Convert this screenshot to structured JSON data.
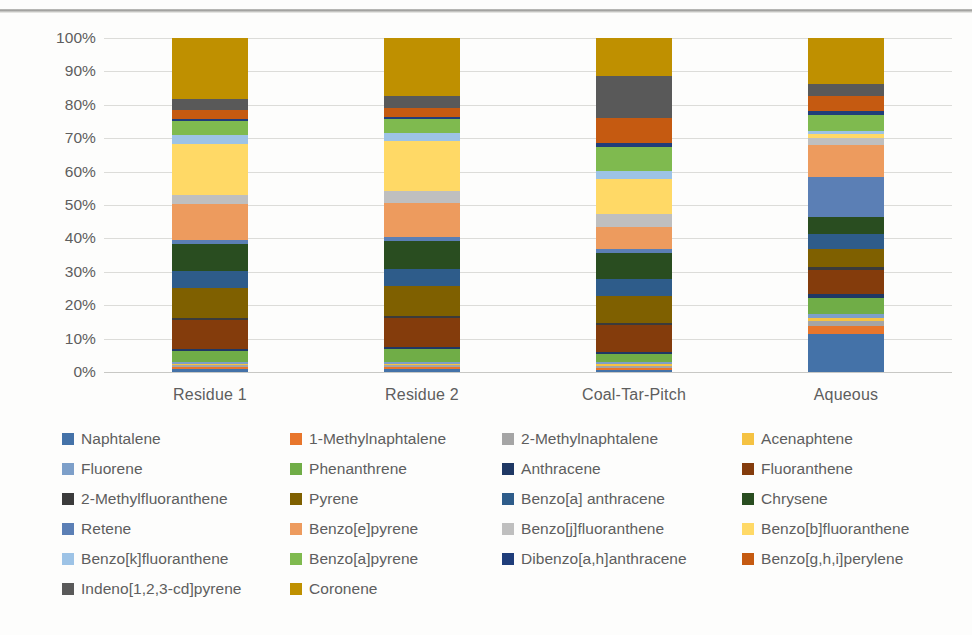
{
  "chart_data": {
    "type": "bar",
    "subtype": "100% stacked bar",
    "title": "",
    "xlabel": "",
    "ylabel": "",
    "ylim": [
      0,
      100
    ],
    "grid": true,
    "legend_position": "bottom",
    "y_ticks": [
      "0%",
      "10%",
      "20%",
      "30%",
      "40%",
      "50%",
      "60%",
      "70%",
      "80%",
      "90%",
      "100%"
    ],
    "categories": [
      "Residue 1",
      "Residue 2",
      "Coal-Tar-Pitch",
      "Aqueous"
    ],
    "series": [
      {
        "name": "Naphtalene",
        "color": "#4472a8",
        "values": [
          0.8,
          0.8,
          0.7,
          11.5
        ]
      },
      {
        "name": "1-Methylnaphtalene",
        "color": "#e8762c",
        "values": [
          0.6,
          0.6,
          0.6,
          2.4
        ]
      },
      {
        "name": "2-Methylnaphtalene",
        "color": "#a5a5a5",
        "values": [
          0.6,
          0.6,
          0.6,
          1.5
        ]
      },
      {
        "name": "Acenaphtene",
        "color": "#f5c242",
        "values": [
          0.5,
          0.5,
          0.5,
          0.9
        ]
      },
      {
        "name": "Fluorene",
        "color": "#7d9fc9",
        "values": [
          0.6,
          0.6,
          0.6,
          1.2
        ]
      },
      {
        "name": "Phenanthrene",
        "color": "#70ad47",
        "values": [
          3.3,
          3.9,
          2.6,
          4.8
        ]
      },
      {
        "name": "Anthracene",
        "color": "#1f3864",
        "values": [
          0.6,
          0.6,
          0.6,
          1.0
        ]
      },
      {
        "name": "Fluoranthene",
        "color": "#843c0c",
        "values": [
          8.6,
          8.7,
          8.0,
          7.2
        ]
      },
      {
        "name": "2-Methylfluoranthene",
        "color": "#3b3b3b",
        "values": [
          0.6,
          0.6,
          0.6,
          0.8
        ]
      },
      {
        "name": "Pyrene",
        "color": "#7f6000",
        "values": [
          8.9,
          9.0,
          8.3,
          5.6
        ]
      },
      {
        "name": "Benzo[a] anthracene",
        "color": "#2e5c8a",
        "values": [
          5.2,
          5.3,
          5.3,
          4.3
        ]
      },
      {
        "name": "Chrysene",
        "color": "#294d20",
        "values": [
          8.0,
          8.3,
          7.7,
          5.1
        ]
      },
      {
        "name": "Retene",
        "color": "#5b7fb5",
        "values": [
          1.1,
          1.2,
          1.2,
          12.2
        ]
      },
      {
        "name": "Benzo[e]pyrene",
        "color": "#ed9b5e",
        "values": [
          10.9,
          10.5,
          6.9,
          9.4
        ]
      },
      {
        "name": "Benzo[j]fluoranthene",
        "color": "#bfbfbf",
        "values": [
          2.6,
          3.6,
          3.9,
          2.2
        ]
      },
      {
        "name": "Benzo[b]fluoranthene",
        "color": "#ffd966",
        "values": [
          15.5,
          15.1,
          10.5,
          1.2
        ]
      },
      {
        "name": "Benzo[k]fluoranthene",
        "color": "#9dc3e6",
        "values": [
          2.6,
          2.5,
          2.6,
          1.0
        ]
      },
      {
        "name": "Benzo[a]pyrene",
        "color": "#7fba4f",
        "values": [
          4.2,
          4.0,
          7.1,
          4.6
        ]
      },
      {
        "name": "Dibenzo[a,h]anthracene",
        "color": "#1f3d7a",
        "values": [
          0.7,
          0.7,
          1.4,
          1.2
        ]
      },
      {
        "name": "Benzo[g,h,i]perylene",
        "color": "#c55a11",
        "values": [
          2.6,
          2.8,
          7.7,
          4.4
        ]
      },
      {
        "name": "Indeno[1,2,3-cd]pyrene",
        "color": "#595959",
        "values": [
          3.3,
          3.6,
          12.6,
          3.8
        ]
      },
      {
        "name": "Coronene",
        "color": "#bf9000",
        "values": [
          18.2,
          17.5,
          11.6,
          13.7
        ]
      }
    ]
  },
  "axis": {
    "y_ticks": [
      "100%",
      "90%",
      "80%",
      "70%",
      "60%",
      "50%",
      "40%",
      "30%",
      "20%",
      "10%",
      "0%"
    ],
    "x_labels": [
      "Residue 1",
      "Residue 2",
      "Coal-Tar-Pitch",
      "Aqueous"
    ]
  },
  "legend": {
    "rows": [
      [
        {
          "label": "Naphtalene",
          "color": "#4472a8"
        },
        {
          "label": "1-Methylnaphtalene",
          "color": "#e8762c"
        },
        {
          "label": "2-Methylnaphtalene",
          "color": "#a5a5a5"
        },
        {
          "label": "Acenaphtene",
          "color": "#f5c242"
        }
      ],
      [
        {
          "label": "Fluorene",
          "color": "#7d9fc9"
        },
        {
          "label": "Phenanthrene",
          "color": "#70ad47"
        },
        {
          "label": "Anthracene",
          "color": "#1f3864"
        },
        {
          "label": "Fluoranthene",
          "color": "#843c0c"
        }
      ],
      [
        {
          "label": "2-Methylfluoranthene",
          "color": "#3b3b3b"
        },
        {
          "label": "Pyrene",
          "color": "#7f6000"
        },
        {
          "label": "Benzo[a] anthracene",
          "color": "#2e5c8a"
        },
        {
          "label": "Chrysene",
          "color": "#294d20"
        }
      ],
      [
        {
          "label": "Retene",
          "color": "#5b7fb5"
        },
        {
          "label": "Benzo[e]pyrene",
          "color": "#ed9b5e"
        },
        {
          "label": "Benzo[j]fluoranthene",
          "color": "#bfbfbf"
        },
        {
          "label": "Benzo[b]fluoranthene",
          "color": "#ffd966"
        }
      ],
      [
        {
          "label": "Benzo[k]fluoranthene",
          "color": "#9dc3e6"
        },
        {
          "label": "Benzo[a]pyrene",
          "color": "#7fba4f"
        },
        {
          "label": "Dibenzo[a,h]anthracene",
          "color": "#1f3d7a"
        },
        {
          "label": "Benzo[g,h,i]perylene",
          "color": "#c55a11"
        }
      ],
      [
        {
          "label": "Indeno[1,2,3-cd]pyrene",
          "color": "#595959"
        },
        {
          "label": "Coronene",
          "color": "#bf9000"
        }
      ]
    ]
  }
}
